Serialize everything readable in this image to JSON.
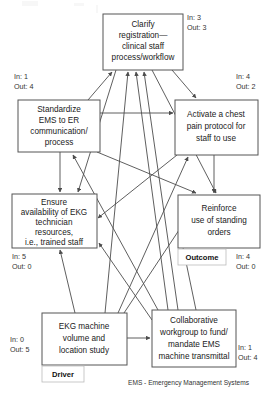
{
  "diagram": {
    "footer_note": "EMS - Emergency Management Systems",
    "nodes": [
      {
        "id": "clarify",
        "lines": [
          "Clarify",
          "registration—",
          "clinical staff",
          "process/workflow"
        ],
        "in_label": "In: 3",
        "out_label": "Out: 3",
        "tag": ""
      },
      {
        "id": "standardize",
        "lines": [
          "Standardize",
          "EMS to ER",
          "communication/",
          "process"
        ],
        "in_label": "In: 1",
        "out_label": "Out: 4",
        "tag": ""
      },
      {
        "id": "activate",
        "lines": [
          "Activate a chest",
          "pain protocol for",
          "staff to use"
        ],
        "in_label": "In: 4",
        "out_label": "Out: 2",
        "tag": ""
      },
      {
        "id": "ensure",
        "lines": [
          "Ensure",
          "availability of EKG",
          "technician",
          "resources,",
          "i.e., trained staff"
        ],
        "in_label": "In: 5",
        "out_label": "Out: 0",
        "tag": ""
      },
      {
        "id": "reinforce",
        "lines": [
          "Reinforce",
          "use of standing",
          "orders"
        ],
        "in_label": "In: 4",
        "out_label": "Out: 0",
        "tag": "Outcome"
      },
      {
        "id": "ekg",
        "lines": [
          "EKG machine",
          "volume and",
          "location study"
        ],
        "in_label": "In: 0",
        "out_label": "Out: 5",
        "tag": "Driver"
      },
      {
        "id": "collaborative",
        "lines": [
          "Collaborative",
          "workgroup to fund/",
          "mandate EMS",
          "machine transmittal"
        ],
        "in_label": "In: 1",
        "out_label": "Out: 4",
        "tag": ""
      }
    ],
    "colors": {
      "box_stroke": "#555555",
      "link_stroke": "#4d4d4d",
      "text": "#1a1a1a",
      "background": "#ffffff"
    }
  }
}
